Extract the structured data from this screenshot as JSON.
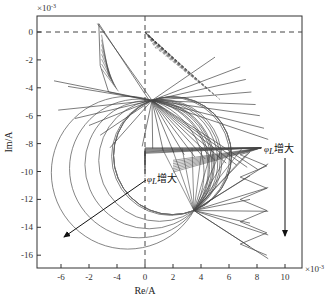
{
  "chart_data": {
    "type": "line",
    "title": "",
    "xlabel": "Re/A",
    "ylabel": "Im/A",
    "x_scale_label": "×10⁻³",
    "y_scale_label": "×10⁻³",
    "xlim": [
      -7.6,
      11.3
    ],
    "ylim": [
      -16.8,
      1.1
    ],
    "x_ticks": [
      -6,
      -4,
      -2,
      0,
      2,
      4,
      6,
      8,
      10
    ],
    "x_tick_labels": [
      "-6",
      "-2",
      "-4",
      "0",
      "2",
      "4",
      "6",
      "8",
      "10"
    ],
    "y_ticks": [
      0,
      -2,
      -4,
      -6,
      -8,
      -10,
      -12,
      -14,
      -16
    ],
    "y_tick_labels": [
      "0",
      "-2",
      "-4",
      "-6",
      "-8",
      "-10",
      "-12",
      "-14",
      "-16"
    ],
    "grid": false,
    "reference_lines": [
      {
        "orientation": "horizontal",
        "value": 0,
        "style": "dashed"
      },
      {
        "orientation": "vertical",
        "value": 0,
        "style": "dashed"
      }
    ],
    "hub_points": [
      {
        "name": "upper-hub",
        "x": 0.5,
        "y": -4.9
      },
      {
        "name": "lower-hub",
        "x": 3.5,
        "y": -12.8
      },
      {
        "name": "horizontal-fan-origin",
        "x": 0.0,
        "y": -8.3
      }
    ],
    "circle_family": {
      "description": "Family of circular arcs passing through the upper and lower hub points, growing leftward",
      "left_extents_x": [
        -6.7,
        -5.4,
        -4.3,
        -3.3,
        -2.4,
        -1.6,
        -0.8,
        -0.1
      ],
      "right_extents_x": [
        9.1,
        8.6,
        8.1,
        7.6,
        7.1
      ]
    },
    "annotations": [
      {
        "text": "φL增大",
        "phi": "φ",
        "sub": "L",
        "suffix": "增大",
        "x": 8.3,
        "y": -8.3,
        "arrow_from": [
          10.0,
          -9.0
        ],
        "arrow_to": [
          10.0,
          -15.5
        ]
      },
      {
        "text": "φL增大",
        "phi": "φ",
        "sub": "L",
        "suffix": "增大",
        "x": 0.3,
        "y": -10.6,
        "arrow_from": [
          0.0,
          -10.8
        ],
        "arrow_to": [
          -6.3,
          -14.8
        ]
      }
    ]
  },
  "labels": {
    "x_title": "Re/A",
    "y_title": "Im/A",
    "x_scale": "×10",
    "x_scale_exp": "-3",
    "y_scale": "×10",
    "y_scale_exp": "-3",
    "anno1_phi": "φ",
    "anno1_sub": "L",
    "anno1_text": "增大",
    "anno2_phi": "φ",
    "anno2_sub": "L",
    "anno2_text": "增大"
  },
  "colors": {
    "axis": "#333333",
    "curve": "#555555",
    "dashed": "#444444",
    "arrow": "#111111"
  }
}
